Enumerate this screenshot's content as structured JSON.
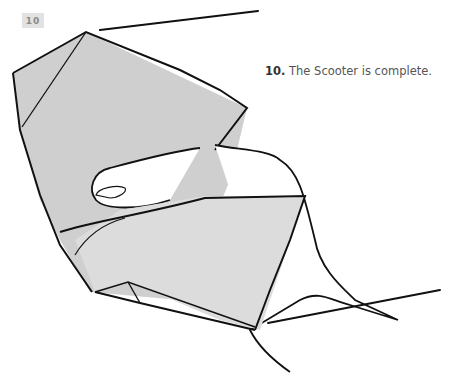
{
  "step": {
    "badge": "10",
    "number": "10.",
    "caption": "The Scooter is complete."
  },
  "illustration": {
    "subject": "hand holding completed origami scooter",
    "paper_color": "#cfcfcf",
    "paper_light_color": "#dcdcdc",
    "line_color": "#111111"
  }
}
